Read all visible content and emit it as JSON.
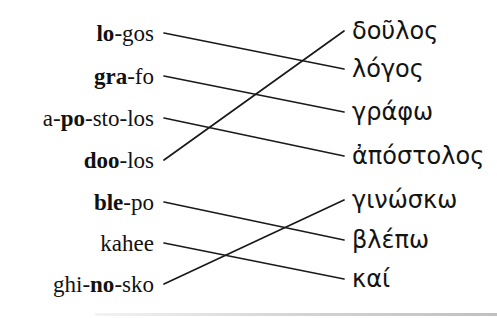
{
  "page": {
    "background": "#ffffff",
    "line_color": "#1a1a1a"
  },
  "matching": {
    "left": [
      {
        "pre": "",
        "bold": "lo",
        "post": "-gos"
      },
      {
        "pre": "",
        "bold": "gra",
        "post": "-fo"
      },
      {
        "pre": "a-",
        "bold": "po",
        "post": "-sto-los"
      },
      {
        "pre": "",
        "bold": "doo",
        "post": "-los"
      },
      {
        "pre": "",
        "bold": "ble",
        "post": "-po"
      },
      {
        "pre": "kahee",
        "bold": "",
        "post": ""
      },
      {
        "pre": "ghi-",
        "bold": "no",
        "post": "-sko"
      }
    ],
    "right": [
      "δοῦλος",
      "λόγος",
      "γράφω",
      "ἀπόστολος",
      "γινώσκω",
      "βλέπω",
      "καί"
    ],
    "connections": [
      {
        "left": 0,
        "right": 1
      },
      {
        "left": 1,
        "right": 2
      },
      {
        "left": 2,
        "right": 3
      },
      {
        "left": 3,
        "right": 0
      },
      {
        "left": 4,
        "right": 5
      },
      {
        "left": 5,
        "right": 6
      },
      {
        "left": 6,
        "right": 4
      }
    ]
  }
}
